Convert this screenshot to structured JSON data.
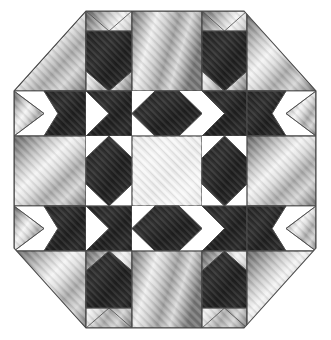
{
  "artwork": {
    "title": "Octagonal Quilt Block",
    "type": "quilt-block-diagram",
    "canvas": {
      "width": 331,
      "height": 340,
      "background": "#ffffff"
    },
    "shape": "octagon",
    "octagon_bounds": {
      "left": 14,
      "top": 11,
      "right": 316,
      "bottom": 328
    },
    "corner_cut": {
      "x": 72,
      "y": 80
    },
    "grid": {
      "columns": 5,
      "rows": 5,
      "x_lines": [
        14,
        86,
        132,
        202,
        247,
        316
      ],
      "y_lines": [
        11,
        91,
        136,
        206,
        251,
        328
      ]
    },
    "fabrics": {
      "dark": {
        "name": "dark-charcoal-fabric",
        "base": "#2b2b2b",
        "highlight": "#3d3d3d",
        "shadow": "#1a1a1a",
        "texture": "diagonal-weave"
      },
      "light": {
        "name": "silver-satin-fabric",
        "base": "#b8b8b8",
        "highlight": "#f2f2f2",
        "shadow": "#6e6e6e",
        "texture": "diagonal-satin-sheen"
      },
      "center": {
        "name": "pale-satin-fabric",
        "base": "#ececec",
        "highlight": "#fafafa",
        "shadow": "#d8d8d8",
        "texture": "diagonal-satin-sheen"
      },
      "background": {
        "name": "white-ground",
        "base": "#ffffff"
      }
    },
    "seam_line": {
      "color": "#4a4a4a",
      "width": 0.8
    },
    "blocks": [
      {
        "id": "r1c1",
        "name": "corner-triangle-top-left",
        "row": 1,
        "col": 1,
        "fabric": "light"
      },
      {
        "id": "r1c2",
        "name": "notched-point-top-left",
        "row": 1,
        "col": 2,
        "fabric": "dark"
      },
      {
        "id": "r1c3",
        "name": "plain-square-top-center",
        "row": 1,
        "col": 3,
        "fabric": "light"
      },
      {
        "id": "r1c4",
        "name": "notched-point-top-right",
        "row": 1,
        "col": 4,
        "fabric": "dark"
      },
      {
        "id": "r1c5",
        "name": "corner-triangle-top-right",
        "row": 1,
        "col": 5,
        "fabric": "light"
      },
      {
        "id": "r2c1",
        "name": "arrow-flag-left-upper",
        "row": 2,
        "col": 1,
        "fabric": "dark"
      },
      {
        "id": "r2c2",
        "name": "bowtie-upper-left",
        "row": 2,
        "col": 2,
        "fabric": "dark"
      },
      {
        "id": "r2c3",
        "name": "hex-bar-top-center",
        "row": 2,
        "col": 3,
        "fabric": "dark"
      },
      {
        "id": "r2c4",
        "name": "bowtie-upper-right",
        "row": 2,
        "col": 4,
        "fabric": "dark"
      },
      {
        "id": "r2c5",
        "name": "arrow-flag-right-upper",
        "row": 2,
        "col": 5,
        "fabric": "dark"
      },
      {
        "id": "r3c1",
        "name": "plain-square-middle-left",
        "row": 3,
        "col": 1,
        "fabric": "light"
      },
      {
        "id": "r3c2",
        "name": "diamond-middle-left",
        "row": 3,
        "col": 2,
        "fabric": "dark"
      },
      {
        "id": "r3c3",
        "name": "center-square",
        "row": 3,
        "col": 3,
        "fabric": "center"
      },
      {
        "id": "r3c4",
        "name": "diamond-middle-right",
        "row": 3,
        "col": 4,
        "fabric": "dark"
      },
      {
        "id": "r3c5",
        "name": "plain-square-middle-right",
        "row": 3,
        "col": 5,
        "fabric": "light"
      },
      {
        "id": "r4c1",
        "name": "arrow-flag-left-lower",
        "row": 4,
        "col": 1,
        "fabric": "dark"
      },
      {
        "id": "r4c2",
        "name": "bowtie-lower-left",
        "row": 4,
        "col": 2,
        "fabric": "dark"
      },
      {
        "id": "r4c3",
        "name": "hex-bar-bottom-center",
        "row": 4,
        "col": 3,
        "fabric": "dark"
      },
      {
        "id": "r4c4",
        "name": "bowtie-lower-right",
        "row": 4,
        "col": 4,
        "fabric": "dark"
      },
      {
        "id": "r4c5",
        "name": "arrow-flag-right-lower",
        "row": 4,
        "col": 5,
        "fabric": "dark"
      },
      {
        "id": "r5c1",
        "name": "corner-triangle-bottom-left",
        "row": 5,
        "col": 1,
        "fabric": "light"
      },
      {
        "id": "r5c2",
        "name": "notched-point-bottom-left",
        "row": 5,
        "col": 2,
        "fabric": "dark"
      },
      {
        "id": "r5c3",
        "name": "plain-square-bottom-center",
        "row": 5,
        "col": 3,
        "fabric": "light"
      },
      {
        "id": "r5c4",
        "name": "notched-point-bottom-right",
        "row": 5,
        "col": 4,
        "fabric": "dark"
      },
      {
        "id": "r5c5",
        "name": "corner-triangle-bottom-right",
        "row": 5,
        "col": 5,
        "fabric": "light"
      }
    ]
  }
}
